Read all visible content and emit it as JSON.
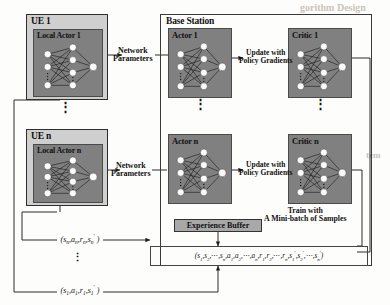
{
  "figure": {
    "kind": "system-architecture-diagram",
    "topic": "Federated multi-agent actor-critic training between user equipments and a base station",
    "colors": {
      "network_panel_fill": "#808080",
      "ue_box_fill": "#cfcfcf",
      "buffer_fill": "#a8a8a8",
      "node_fill": "#ffffff",
      "line": "#222222",
      "page_background": "#fdfdfb"
    }
  },
  "ue_side": {
    "ue_first": {
      "title": "UE 1",
      "actor_label": "Local Actor 1"
    },
    "ue_last": {
      "title": "UE n",
      "actor_label": "Local Actor n"
    },
    "vertical_dots": "⋮"
  },
  "base_station": {
    "title": "Base Station",
    "actor_first_label": "Actor 1",
    "actor_last_label": "Actor n",
    "critic_first_label": "Critic 1",
    "critic_last_label": "Critic n",
    "vertical_dots": "⋮"
  },
  "connectors": {
    "network_parameters_top": "Network\nParameters",
    "network_parameters_top_line1": "Network",
    "network_parameters_top_line2": "Parameters",
    "network_parameters_bottom_line1": "Network",
    "network_parameters_bottom_line2": "Parameters",
    "policy_gradients_top_line1": "Update with",
    "policy_gradients_top_line2": "Policy Gradients",
    "policy_gradients_bottom_line1": "Update with",
    "policy_gradients_bottom_line2": "Policy Gradients",
    "train_line1": "Train with",
    "train_line2": "A Mini-batch of Samples"
  },
  "experience_buffer": {
    "label": "Experience Buffer",
    "batch_tuple_plain": "(s1,s2,...,sn,a1,a2,...,an,r1,r2,...,rn,s1',s2',...,sn')"
  },
  "transitions": {
    "from_ue_n_plain": "(sn,an,rn,sn')",
    "from_ue_1_plain": "(s1,a1,r1,s1')",
    "vertical_dots": "⋮"
  },
  "ghost_text": {
    "top_right": "gorithm Design",
    "mid_right": "tem"
  },
  "network_shape": {
    "input_nodes": 3,
    "hidden_nodes": 4,
    "output_nodes": 1,
    "dots_between_layers": "⋮"
  }
}
